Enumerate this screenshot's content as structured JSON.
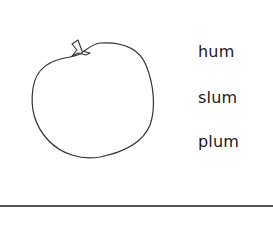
{
  "worksheet": {
    "picture": "apple",
    "words": [
      "hum",
      "slum",
      "plum"
    ],
    "line_color": "#555555",
    "text_color": "#1a1a1a"
  }
}
